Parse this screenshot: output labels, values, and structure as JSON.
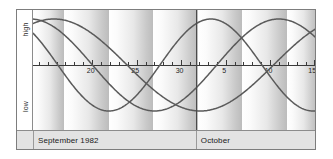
{
  "chart_data": {
    "type": "line",
    "xlabel": "",
    "ylabel": "",
    "ylim": [
      -1,
      1
    ],
    "grid": false,
    "legend": "none",
    "y_axis_labels": {
      "high": "high",
      "low": "low"
    },
    "x_tick_labels": [
      "20",
      "25",
      "30",
      "5",
      "10",
      "15"
    ],
    "x_tick_positions_px": [
      63,
      110,
      157,
      204,
      251,
      297
    ],
    "x_axis_range_days": [
      14.5,
      46.5
    ],
    "months": [
      {
        "label": "September 1982",
        "start_px": 0,
        "end_px": 172
      },
      {
        "label": "October",
        "start_px": 172,
        "end_px": 300
      }
    ],
    "month_divider_px": 172,
    "week_bands_px": [
      {
        "start": 0,
        "end": 33
      },
      {
        "start": 33,
        "end": 80
      },
      {
        "start": 80,
        "end": 127
      },
      {
        "start": 127,
        "end": 174
      },
      {
        "start": 174,
        "end": 221
      },
      {
        "start": 221,
        "end": 268
      },
      {
        "start": 268,
        "end": 300
      }
    ],
    "series": [
      {
        "name": "physical",
        "period_days": 23,
        "phase_offset_days": 5.8,
        "amplitude": 1.0,
        "color": "#5a5a5a",
        "stroke_width": 1.5
      },
      {
        "name": "emotional",
        "period_days": 28,
        "phase_offset_days": 7.2,
        "amplitude": 1.0,
        "color": "#5a5a5a",
        "stroke_width": 1.5
      },
      {
        "name": "intellectual",
        "period_days": 33,
        "phase_offset_days": 8.6,
        "amplitude": 1.0,
        "color": "#5a5a5a",
        "stroke_width": 1.5
      }
    ],
    "colors": {
      "curve": "#5a5a5a",
      "axis": "#3a3a3a",
      "frame": "#7d7d7d",
      "month_bar": "#e3e3e3",
      "band_light": "#ffffff",
      "band_dark": "#bcbcbc"
    }
  }
}
